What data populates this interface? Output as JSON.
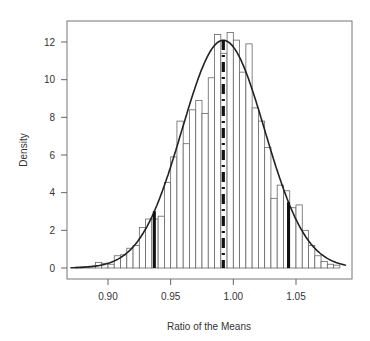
{
  "chart_data": {
    "type": "bar",
    "title": "",
    "xlabel": "Ratio of the Means",
    "ylabel": "Density",
    "xlim": [
      0.87,
      1.09
    ],
    "ylim": [
      -0.5,
      13.0
    ],
    "xticks": [
      0.9,
      0.95,
      1.0,
      1.05
    ],
    "xtick_labels": [
      "0.90",
      "0.95",
      "1.00",
      "1.05"
    ],
    "yticks": [
      0,
      2,
      4,
      6,
      8,
      10,
      12
    ],
    "ytick_labels": [
      "0",
      "2",
      "4",
      "6",
      "8",
      "10",
      "12"
    ],
    "grid": false,
    "legend": null,
    "histogram": {
      "bin_width": 0.005,
      "bin_starts": [
        0.875,
        0.88,
        0.885,
        0.89,
        0.895,
        0.9,
        0.905,
        0.91,
        0.915,
        0.92,
        0.925,
        0.93,
        0.935,
        0.94,
        0.945,
        0.95,
        0.955,
        0.96,
        0.965,
        0.97,
        0.975,
        0.98,
        0.985,
        0.99,
        0.995,
        1.0,
        1.005,
        1.01,
        1.015,
        1.02,
        1.025,
        1.03,
        1.035,
        1.04,
        1.045,
        1.05,
        1.055,
        1.06,
        1.065,
        1.07,
        1.075,
        1.08
      ],
      "density": [
        0.05,
        0.07,
        0.1,
        0.3,
        0.25,
        0.2,
        0.65,
        0.7,
        1.05,
        1.2,
        2.15,
        2.6,
        2.6,
        2.75,
        4.55,
        5.9,
        7.8,
        6.6,
        8.4,
        8.9,
        8.2,
        10.1,
        12.4,
        11.4,
        12.5,
        12.1,
        10.4,
        11.9,
        8.5,
        7.8,
        6.4,
        3.7,
        4.4,
        4.1,
        3.2,
        3.35,
        2.0,
        1.2,
        0.65,
        0.35,
        0.2,
        0.15
      ]
    },
    "density_curve": {
      "type": "normal",
      "mean": 0.992,
      "sd": 0.033
    },
    "vertical_lines": [
      {
        "name": "lower-2.5-percentile",
        "x": 0.937,
        "style": "solid-thick"
      },
      {
        "name": "mean",
        "x": 0.992,
        "style": "dash-dot-thick"
      },
      {
        "name": "upper-97.5-percentile",
        "x": 1.044,
        "style": "solid-thick"
      }
    ]
  }
}
